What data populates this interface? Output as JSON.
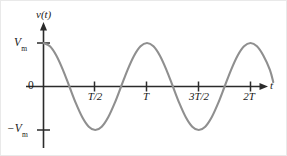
{
  "figure": {
    "name": "sinusoidal-voltage-waveform",
    "background_color": "#ffffff",
    "width": 287,
    "height": 156
  },
  "axes": {
    "y_axis": {
      "label": "v(t)",
      "label_italic_part": "v",
      "label_rest": "(t)",
      "arrow": "up-arrow",
      "color": "#2b2b2b"
    },
    "x_axis": {
      "label": "t",
      "arrow": "right-arrow",
      "color": "#2b2b2b"
    },
    "y_tick_labels": {
      "positive_peak": "V",
      "positive_peak_sub": "m",
      "origin": "0",
      "negative_peak": "−V",
      "negative_peak_sub": "m"
    }
  },
  "chart_data": {
    "type": "line",
    "title": "",
    "xlabel": "t",
    "ylabel": "v(t)",
    "waveform": "cosine",
    "equation": "v(t) = V_m cos(2πt/T)",
    "amplitude_label": "V_m",
    "period_label": "T",
    "line_color": "#8f8f8f",
    "line_width": 2.1,
    "grid": false,
    "legend": null,
    "xlim": [
      0,
      2.25
    ],
    "ylim": [
      -1,
      1
    ],
    "x_tick_values": [
      0.5,
      1,
      1.5,
      2
    ],
    "x_tick_labels": [
      "T/2",
      "T",
      "3T/2",
      "2T"
    ],
    "y_tick_values": [
      1,
      0,
      -1
    ],
    "y_tick_labels": [
      "Vₘ",
      "0",
      "−Vₘ"
    ],
    "x": [
      0,
      0.0625,
      0.125,
      0.1875,
      0.25,
      0.3125,
      0.375,
      0.4375,
      0.5,
      0.5625,
      0.625,
      0.6875,
      0.75,
      0.8125,
      0.875,
      0.9375,
      1,
      1.0625,
      1.125,
      1.1875,
      1.25,
      1.3125,
      1.375,
      1.4375,
      1.5,
      1.5625,
      1.625,
      1.6875,
      1.75,
      1.8125,
      1.875,
      1.9375,
      2,
      2.0625,
      2.125,
      2.1875,
      2.22
    ],
    "y": [
      1,
      0.9239,
      0.7071,
      0.3827,
      0,
      -0.3827,
      -0.7071,
      -0.9239,
      -1,
      -0.9239,
      -0.7071,
      -0.3827,
      0,
      0.3827,
      0.7071,
      0.9239,
      1,
      0.9239,
      0.7071,
      0.3827,
      0,
      -0.3827,
      -0.7071,
      -0.9239,
      -1,
      -0.9239,
      -0.7071,
      -0.3827,
      0,
      0.3827,
      0.7071,
      0.9239,
      1,
      0.9239,
      0.7071,
      0.3827,
      0.1
    ]
  },
  "labels": {
    "y_axis_caption": "v(t)",
    "vm": "V",
    "vm_sub": "m",
    "zero": "0",
    "neg_vm": "−V",
    "neg_vm_sub": "m",
    "t_half": "T/2",
    "t_full": "T",
    "three_t_half": "3T/2",
    "two_t": "2T",
    "x_axis_caption": "t"
  }
}
